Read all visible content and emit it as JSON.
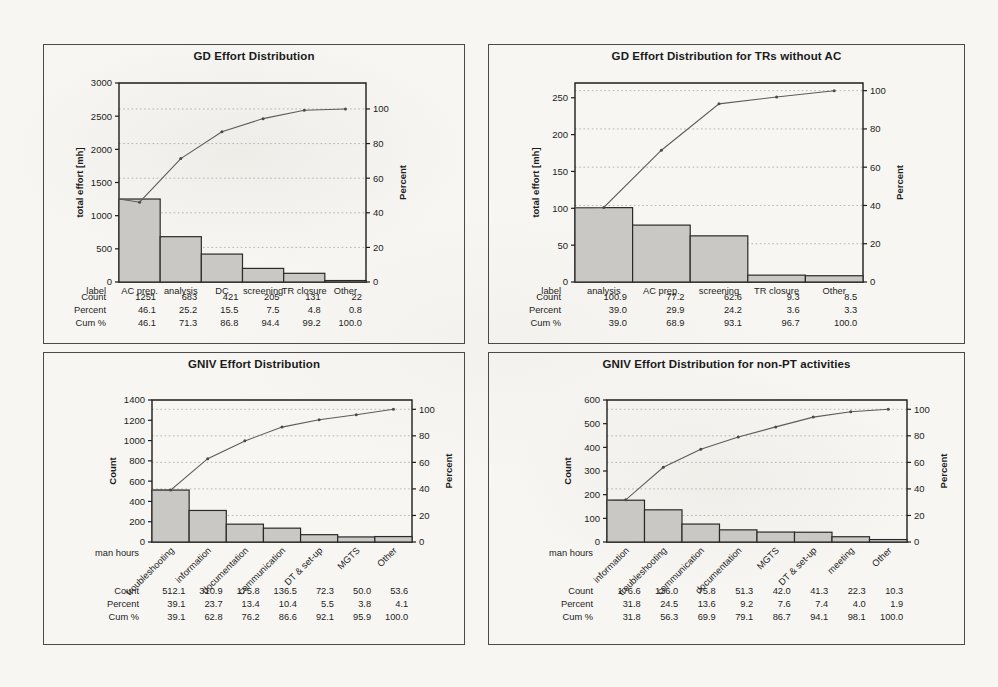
{
  "page": {
    "background": "#f7f6f2",
    "bar_fill": "#c9c8c4",
    "bar_stroke": "#2a2a2a",
    "line_color": "#5c5c5c"
  },
  "panels": [
    {
      "name": "gd-effort-distribution",
      "title": "GD Effort Distribution",
      "chart_data": {
        "type": "bar",
        "title": "GD Effort Distribution",
        "xlabel": "label",
        "ylabel": "total effort [mh]",
        "y2label": "Percent",
        "categories": [
          "AC prep.",
          "analysis",
          "DC",
          "screening",
          "TR closure",
          "Other"
        ],
        "values": [
          1251,
          683,
          421,
          205,
          131,
          22
        ],
        "cum_percent": [
          46.1,
          71.3,
          86.8,
          94.4,
          99.2,
          100.0
        ],
        "percent": [
          46.1,
          25.2,
          15.5,
          7.5,
          4.8,
          0.8
        ],
        "ylim": [
          0,
          3000
        ],
        "yticks": [
          0,
          500,
          1000,
          1500,
          2000,
          2500,
          3000
        ],
        "y2lim": [
          0,
          115
        ],
        "y2ticks": [
          0,
          20,
          40,
          60,
          80,
          100
        ],
        "grid": true,
        "legend": "none",
        "rotated_labels": false,
        "table_rows": [
          {
            "label": "label",
            "values": [
              "AC prep.",
              "analysis",
              "DC",
              "screening",
              "TR closure",
              "Other"
            ]
          },
          {
            "label": "Count",
            "values": [
              "1251",
              "683",
              "421",
              "205",
              "131",
              "22"
            ]
          },
          {
            "label": "Percent",
            "values": [
              "46.1",
              "25.2",
              "15.5",
              "7.5",
              "4.8",
              "0.8"
            ]
          },
          {
            "label": "Cum %",
            "values": [
              "46.1",
              "71.3",
              "86.8",
              "94.4",
              "99.2",
              "100.0"
            ]
          }
        ]
      }
    },
    {
      "name": "gd-effort-distribution-trs-without-ac",
      "title": "GD Effort Distribution for TRs without AC",
      "chart_data": {
        "type": "bar",
        "title": "GD Effort Distribution for TRs without AC",
        "xlabel": "label",
        "ylabel": "total effort [mh]",
        "y2label": "Percent",
        "categories": [
          "analysis",
          "AC prep.",
          "screening",
          "TR closure",
          "Other"
        ],
        "values": [
          100.9,
          77.2,
          62.6,
          9.3,
          8.5
        ],
        "cum_percent": [
          39.0,
          68.9,
          93.1,
          96.7,
          100.0
        ],
        "percent": [
          39.0,
          29.9,
          24.2,
          3.6,
          3.3
        ],
        "ylim": [
          0,
          270
        ],
        "yticks": [
          0,
          50,
          100,
          150,
          200,
          250
        ],
        "y2lim": [
          0,
          104
        ],
        "y2ticks": [
          0,
          20,
          40,
          60,
          80,
          100
        ],
        "grid": true,
        "legend": "none",
        "rotated_labels": false,
        "table_rows": [
          {
            "label": "label",
            "values": [
              "analysis",
              "AC prep.",
              "screening",
              "TR closure",
              "Other"
            ]
          },
          {
            "label": "Count",
            "values": [
              "100.9",
              "77.2",
              "62.6",
              "9.3",
              "8.5"
            ]
          },
          {
            "label": "Percent",
            "values": [
              "39.0",
              "29.9",
              "24.2",
              "3.6",
              "3.3"
            ]
          },
          {
            "label": "Cum %",
            "values": [
              "39.0",
              "68.9",
              "93.1",
              "96.7",
              "100.0"
            ]
          }
        ]
      }
    },
    {
      "name": "gniv-effort-distribution",
      "title": "GNIV Effort Distribution",
      "chart_data": {
        "type": "bar",
        "title": "GNIV Effort Distribution",
        "xlabel": "man hours",
        "ylabel": "Count",
        "y2label": "Percent",
        "categories": [
          "troubleshooting",
          "information",
          "documentation",
          "communication",
          "DT & set-up",
          "MGTS",
          "Other"
        ],
        "values": [
          512.1,
          310.9,
          175.8,
          136.5,
          72.3,
          50.0,
          53.6
        ],
        "cum_percent": [
          39.1,
          62.8,
          76.2,
          86.6,
          92.1,
          95.9,
          100.0
        ],
        "percent": [
          39.1,
          23.7,
          13.4,
          10.4,
          5.5,
          3.8,
          4.1
        ],
        "ylim": [
          0,
          1400
        ],
        "yticks": [
          0,
          200,
          400,
          600,
          800,
          1000,
          1200,
          1400
        ],
        "y2lim": [
          0,
          107
        ],
        "y2ticks": [
          0,
          20,
          40,
          60,
          80,
          100
        ],
        "grid": true,
        "legend": "none",
        "rotated_labels": true,
        "table_rows": [
          {
            "label": "Count",
            "values": [
              "512.1",
              "310.9",
              "175.8",
              "136.5",
              "72.3",
              "50.0",
              "53.6"
            ]
          },
          {
            "label": "Percent",
            "values": [
              "39.1",
              "23.7",
              "13.4",
              "10.4",
              "5.5",
              "3.8",
              "4.1"
            ]
          },
          {
            "label": "Cum %",
            "values": [
              "39.1",
              "62.8",
              "76.2",
              "86.6",
              "92.1",
              "95.9",
              "100.0"
            ]
          }
        ]
      }
    },
    {
      "name": "gniv-effort-distribution-non-pt",
      "title": "GNIV Effort Distribution for non-PT activities",
      "chart_data": {
        "type": "bar",
        "title": "GNIV Effort Distribution for non-PT activities",
        "xlabel": "man hours",
        "ylabel": "Count",
        "y2label": "Percent",
        "categories": [
          "information",
          "troubleshooting",
          "communication",
          "documentation",
          "MGTS",
          "DT & set-up",
          "meeting",
          "Other"
        ],
        "values": [
          176.6,
          136.0,
          75.8,
          51.3,
          42.0,
          41.3,
          22.3,
          10.3
        ],
        "cum_percent": [
          31.8,
          56.3,
          69.9,
          79.1,
          86.7,
          94.1,
          98.1,
          100.0
        ],
        "percent": [
          31.8,
          24.5,
          13.6,
          9.2,
          7.6,
          7.4,
          4.0,
          1.9
        ],
        "ylim": [
          0,
          600
        ],
        "yticks": [
          0,
          100,
          200,
          300,
          400,
          500,
          600
        ],
        "y2lim": [
          0,
          107
        ],
        "y2ticks": [
          0,
          20,
          40,
          60,
          80,
          100
        ],
        "grid": true,
        "legend": "none",
        "rotated_labels": true,
        "table_rows": [
          {
            "label": "Count",
            "values": [
              "176.6",
              "136.0",
              "75.8",
              "51.3",
              "42.0",
              "41.3",
              "22.3",
              "10.3"
            ]
          },
          {
            "label": "Percent",
            "values": [
              "31.8",
              "24.5",
              "13.6",
              "9.2",
              "7.6",
              "7.4",
              "4.0",
              "1.9"
            ]
          },
          {
            "label": "Cum %",
            "values": [
              "31.8",
              "56.3",
              "69.9",
              "79.1",
              "86.7",
              "94.1",
              "98.1",
              "100.0"
            ]
          }
        ]
      }
    }
  ]
}
